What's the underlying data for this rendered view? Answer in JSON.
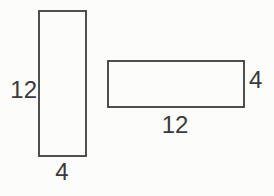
{
  "diagram": {
    "colors": {
      "background": "#fcfcfa",
      "line": "#3d3d3d",
      "text": "#3a3a3a"
    },
    "vertical_rectangle": {
      "height_label": "12",
      "width_label": "4"
    },
    "horizontal_rectangle": {
      "width_label": "12",
      "height_label": "4"
    }
  }
}
